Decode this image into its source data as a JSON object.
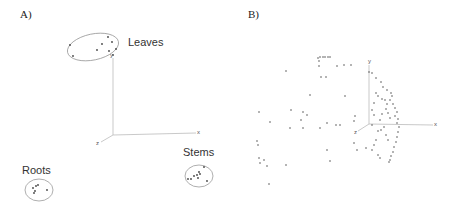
{
  "figure": {
    "panels": [
      {
        "label": "A)"
      },
      {
        "label": "B)"
      }
    ]
  },
  "chart_data": [
    {
      "type": "scatter",
      "panel": "A)",
      "title": "",
      "projection": "3d",
      "axes": {
        "x": "x",
        "y": "y",
        "z": "z"
      },
      "grid": false,
      "annotations": [
        "Leaves",
        "Stems",
        "Roots"
      ],
      "clusters": [
        {
          "name": "Leaves",
          "encircled": true,
          "points_px": [
            [
              70,
              45
            ],
            [
              73,
              56
            ],
            [
              97,
              50
            ],
            [
              102,
              44
            ],
            [
              108,
              37
            ],
            [
              112,
              42
            ],
            [
              109,
              51
            ],
            [
              113,
              55
            ],
            [
              116,
              49
            ]
          ]
        },
        {
          "name": "Stems",
          "encircled": true,
          "points_px": [
            [
              188,
              179
            ],
            [
              191,
              179
            ],
            [
              194,
              176
            ],
            [
              197,
              175
            ],
            [
              199,
              172
            ],
            [
              200,
              174
            ],
            [
              198,
              178
            ],
            [
              204,
              167
            ],
            [
              207,
              181
            ]
          ]
        },
        {
          "name": "Roots",
          "encircled": true,
          "points_px": [
            [
              33,
              188
            ],
            [
              35,
              191
            ],
            [
              36,
              186
            ],
            [
              38,
              185
            ],
            [
              34,
              193
            ],
            [
              47,
              190
            ]
          ]
        }
      ]
    },
    {
      "type": "scatter",
      "panel": "B)",
      "title": "",
      "projection": "3d",
      "axes": {
        "x": "x",
        "y": "y",
        "z": "z"
      },
      "grid": false,
      "points_px": [
        [
          318,
          58
        ],
        [
          320,
          57
        ],
        [
          323,
          57
        ],
        [
          325,
          57
        ],
        [
          328,
          57
        ],
        [
          330,
          57
        ],
        [
          319,
          61
        ],
        [
          319,
          66
        ],
        [
          326,
          77
        ],
        [
          321,
          77
        ],
        [
          337,
          66
        ],
        [
          344,
          65
        ],
        [
          351,
          65
        ],
        [
          286,
          71
        ],
        [
          310,
          95
        ],
        [
          345,
          96
        ],
        [
          259,
          112
        ],
        [
          291,
          110
        ],
        [
          303,
          112
        ],
        [
          307,
          115
        ],
        [
          301,
          120
        ],
        [
          327,
          123
        ],
        [
          336,
          125
        ],
        [
          340,
          125
        ],
        [
          270,
          122
        ],
        [
          290,
          128
        ],
        [
          303,
          128
        ],
        [
          320,
          128
        ],
        [
          355,
          116
        ],
        [
          354,
          121
        ],
        [
          257,
          141
        ],
        [
          258,
          145
        ],
        [
          259,
          158
        ],
        [
          260,
          163
        ],
        [
          264,
          160
        ],
        [
          267,
          166
        ],
        [
          286,
          165
        ],
        [
          327,
          150
        ],
        [
          330,
          161
        ],
        [
          354,
          143
        ],
        [
          357,
          150
        ],
        [
          366,
          148
        ],
        [
          269,
          184
        ],
        [
          369,
          72
        ],
        [
          372,
          73
        ],
        [
          376,
          78
        ],
        [
          381,
          82
        ],
        [
          383,
          87
        ],
        [
          387,
          90
        ],
        [
          391,
          93
        ],
        [
          392,
          96
        ],
        [
          390,
          100
        ],
        [
          393,
          104
        ],
        [
          395,
          108
        ],
        [
          397,
          112
        ],
        [
          395,
          116
        ],
        [
          398,
          119
        ],
        [
          397,
          123
        ],
        [
          399,
          127
        ],
        [
          398,
          132
        ],
        [
          397,
          137
        ],
        [
          396,
          142
        ],
        [
          394,
          147
        ],
        [
          393,
          152
        ],
        [
          391,
          156
        ],
        [
          390,
          160
        ],
        [
          389,
          162
        ],
        [
          386,
          109
        ],
        [
          382,
          114
        ],
        [
          380,
          120
        ],
        [
          384,
          127
        ],
        [
          378,
          131
        ],
        [
          376,
          140
        ],
        [
          374,
          145
        ],
        [
          372,
          150
        ],
        [
          378,
          155
        ],
        [
          380,
          158
        ],
        [
          374,
          103
        ],
        [
          376,
          93
        ],
        [
          378,
          96
        ],
        [
          382,
          99
        ],
        [
          372,
          110
        ],
        [
          374,
          115
        ],
        [
          385,
          100
        ],
        [
          387,
          104
        ],
        [
          388,
          113
        ],
        [
          390,
          118
        ],
        [
          386,
          135
        ],
        [
          388,
          140
        ],
        [
          372,
          125
        ],
        [
          381,
          130
        ]
      ]
    }
  ]
}
